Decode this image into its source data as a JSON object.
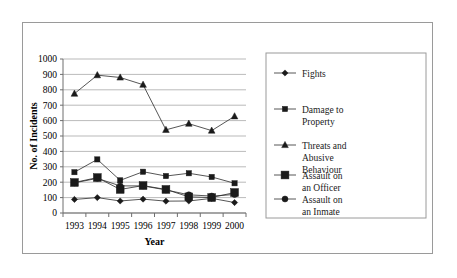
{
  "chart_data": {
    "type": "line",
    "title": "",
    "xlabel": "Year",
    "ylabel": "No. of Incidents",
    "categories": [
      "1993",
      "1994",
      "1995",
      "1996",
      "1997",
      "1998",
      "1999",
      "2000"
    ],
    "ylim": [
      0,
      1000
    ],
    "ytick_step": 100,
    "yticks": [
      "0",
      "100",
      "200",
      "300",
      "400",
      "500",
      "600",
      "700",
      "800",
      "900",
      "1000"
    ],
    "grid": true,
    "legend_position": "right",
    "series": [
      {
        "name": "Fights",
        "marker": "diamond",
        "values": [
          88,
          100,
          78,
          90,
          77,
          78,
          95,
          68
        ]
      },
      {
        "name": "Damage to Property",
        "marker": "square-small",
        "values": [
          265,
          348,
          212,
          268,
          240,
          258,
          234,
          193
        ]
      },
      {
        "name": "Threats and Abusive Behaviour",
        "marker": "triangle",
        "values": [
          775,
          895,
          880,
          833,
          540,
          580,
          535,
          628
        ]
      },
      {
        "name": "Assault on an Officer",
        "marker": "square-large",
        "values": [
          198,
          230,
          153,
          178,
          153,
          105,
          100,
          133
        ]
      },
      {
        "name": "Assault on an Inmate",
        "marker": "circle",
        "values": [
          196,
          225,
          176,
          176,
          150,
          118,
          110,
          120
        ]
      }
    ]
  },
  "legend": {
    "entries": [
      {
        "label": "Fights"
      },
      {
        "label": "Damage to Property"
      },
      {
        "label": "Threats and Abusive Behaviour"
      },
      {
        "label": "Assault on an Officer"
      },
      {
        "label": "Assault on an Inmate"
      }
    ]
  }
}
